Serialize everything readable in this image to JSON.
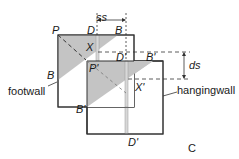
{
  "figure": {
    "panel_label": "C",
    "colors": {
      "shade": "#c4c4c4",
      "line": "#333333",
      "strip": "#d8d8d8",
      "background": "#ffffff"
    },
    "blocks": {
      "footwall_label": "footwall",
      "hangingwall_label": "hangingwall"
    },
    "points": {
      "P": "P",
      "D": "D",
      "B": "B",
      "X": "X",
      "P_prime": "P'",
      "D_prime_top": "D'",
      "B_prime_top": "B'",
      "X_prime": "X'",
      "B_prime_bottom": "B'",
      "D_prime_bottom": "D'"
    },
    "dimensions": {
      "strike_separation": "ss",
      "dip_separation": "ds"
    }
  }
}
